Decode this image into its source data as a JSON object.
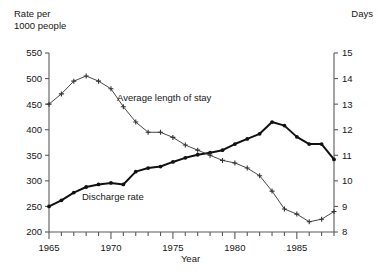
{
  "chart_data": {
    "type": "line",
    "title": "",
    "xlabel": "Year",
    "ylabel_left": "Rate per\n1000 people",
    "ylabel_right": "Days",
    "xlim": [
      1965,
      1988
    ],
    "ylim_left": [
      200,
      550
    ],
    "ylim_right": [
      8,
      15
    ],
    "xticks_major": [
      1965,
      1970,
      1975,
      1980,
      1985
    ],
    "xticks_minor_step": 1,
    "yticks_left": [
      200,
      250,
      300,
      350,
      400,
      450,
      500,
      550
    ],
    "yticks_right": [
      8,
      9,
      10,
      11,
      12,
      13,
      14,
      15
    ],
    "grid": false,
    "legend_position": "inline-annotations",
    "x": [
      1965,
      1966,
      1967,
      1968,
      1969,
      1970,
      1971,
      1972,
      1973,
      1974,
      1975,
      1976,
      1977,
      1978,
      1979,
      1980,
      1981,
      1982,
      1983,
      1984,
      1985,
      1986,
      1987,
      1988
    ],
    "series": [
      {
        "name": "Discharge rate",
        "axis": "left",
        "unit": "per 1000 people",
        "marker": "dot",
        "line_weight": "thick",
        "color": "#111111",
        "values": [
          250,
          262,
          277,
          288,
          293,
          296,
          293,
          318,
          325,
          328,
          337,
          345,
          351,
          355,
          360,
          372,
          382,
          392,
          415,
          408,
          386,
          372,
          372,
          342
        ]
      },
      {
        "name": "Average length of stay",
        "axis": "right",
        "unit": "days",
        "marker": "plus",
        "line_weight": "thin",
        "color": "#333333",
        "values": [
          13.0,
          13.4,
          13.9,
          14.1,
          13.9,
          13.6,
          12.9,
          12.3,
          11.9,
          11.9,
          11.7,
          11.4,
          11.2,
          11.0,
          10.8,
          10.7,
          10.5,
          10.2,
          9.6,
          8.9,
          8.7,
          8.4,
          8.5,
          8.8
        ]
      }
    ],
    "annotations": [
      {
        "text": "Average length of stay",
        "points_to_series": "Average length of stay",
        "near_x": 1972
      },
      {
        "text": "Discharge rate",
        "points_to_series": "Discharge rate",
        "near_x": 1969
      }
    ]
  },
  "axes": {
    "left_title": "Rate per\n1000 people",
    "right_title": "Days",
    "x_title": "Year"
  },
  "tick_labels": {
    "left": [
      "550",
      "500",
      "450",
      "400",
      "350",
      "300",
      "250",
      "200"
    ],
    "right": [
      "15",
      "14",
      "13",
      "12",
      "11",
      "10",
      "9",
      "8"
    ],
    "bottom": [
      "1965",
      "1970",
      "1975",
      "1980",
      "1985"
    ]
  },
  "series_labels": {
    "length_of_stay": "Average length of stay",
    "discharge_rate": "Discharge rate"
  },
  "colors": {
    "ink": "#111111",
    "axis": "#5a5a5a",
    "background": "#ffffff"
  }
}
